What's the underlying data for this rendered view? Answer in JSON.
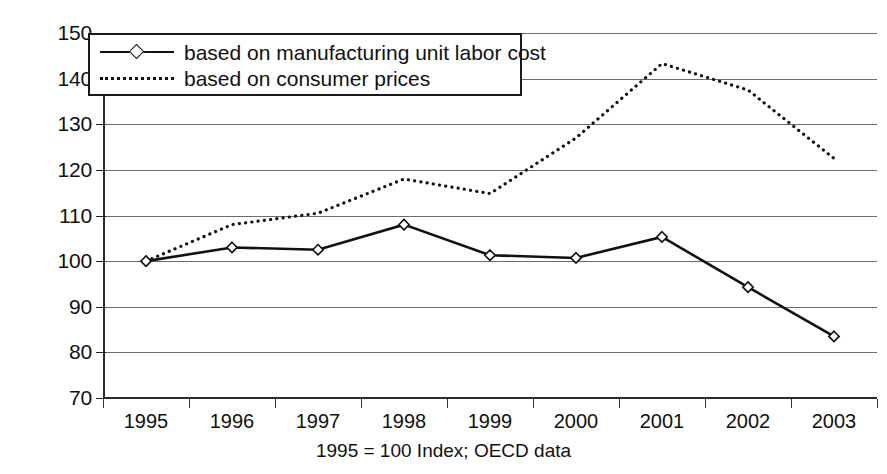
{
  "chart_data": {
    "type": "line",
    "title": "",
    "subtitle": "",
    "xlabel": "",
    "ylabel": "",
    "caption": "1995 = 100 Index; OECD data",
    "categories": [
      "1995",
      "1996",
      "1997",
      "1998",
      "1999",
      "2000",
      "2001",
      "2002",
      "2003"
    ],
    "ylim": [
      70,
      150
    ],
    "ytick_labels": [
      "150",
      "140",
      "130",
      "120",
      "110",
      "100",
      "90",
      "80",
      "70"
    ],
    "yticks": [
      150,
      140,
      130,
      120,
      110,
      100,
      90,
      80,
      70
    ],
    "grid": true,
    "legend_position": "top-left",
    "series": [
      {
        "name": "based on manufacturing unit labor cost",
        "style": "solid",
        "marker": "diamond",
        "color": "#111111",
        "values": [
          100.0,
          103.0,
          102.5,
          108.0,
          101.3,
          100.7,
          105.3,
          94.3,
          83.5
        ]
      },
      {
        "name": "based on consumer prices",
        "style": "dotted",
        "marker": "none",
        "color": "#111111",
        "values": [
          100.0,
          108.0,
          110.5,
          118.0,
          114.8,
          127.0,
          143.3,
          137.5,
          122.5
        ]
      }
    ]
  },
  "axes": {
    "y_labels": [
      "150",
      "140",
      "130",
      "120",
      "110",
      "100",
      "90",
      "80",
      "70"
    ],
    "x_labels": [
      "1995",
      "1996",
      "1997",
      "1998",
      "1999",
      "2000",
      "2001",
      "2002",
      "2003"
    ]
  },
  "legend": {
    "items": [
      {
        "label": "based on manufacturing unit labor cost",
        "style": "solid-diamond"
      },
      {
        "label": "based on consumer prices",
        "style": "dotted"
      }
    ]
  },
  "footer": {
    "caption": "1995 = 100 Index; OECD data"
  }
}
